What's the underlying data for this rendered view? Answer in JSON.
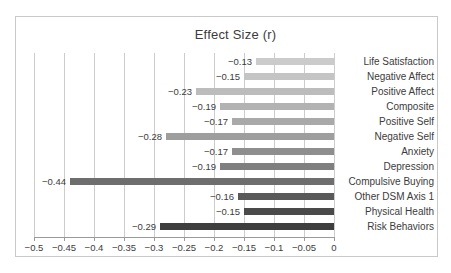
{
  "figure": {
    "title": "Effect Size (r)",
    "border_color": "#c9c9c9",
    "background_color": "#ffffff"
  },
  "chart_data": {
    "type": "bar",
    "orientation": "horizontal",
    "title": "Effect Size (r)",
    "categories": [
      "Life Satisfaction",
      "Negative Affect",
      "Positive Affect",
      "Composite",
      "Positive Self",
      "Negative Self",
      "Anxiety",
      "Depression",
      "Compulsive Buying",
      "Other DSM Axis 1",
      "Physical Health",
      "Risk Behaviors"
    ],
    "values": [
      -0.13,
      -0.15,
      -0.23,
      -0.19,
      -0.17,
      -0.28,
      -0.17,
      -0.19,
      -0.44,
      -0.16,
      -0.15,
      -0.29
    ],
    "value_labels": [
      "−0.13",
      "−0.15",
      "−0.23",
      "−0.19",
      "−0.17",
      "−0.28",
      "−0.17",
      "−0.19",
      "−0.44",
      "−0.16",
      "−0.15",
      "−0.29"
    ],
    "xlabel": "",
    "ylabel": "",
    "xlim": [
      -0.5,
      0
    ],
    "x_ticks": [
      -0.5,
      -0.45,
      -0.4,
      -0.35,
      -0.3,
      -0.25,
      -0.2,
      -0.15,
      -0.1,
      -0.05,
      0
    ],
    "x_tick_labels": [
      "−0.5",
      "−0.45",
      "−0.4",
      "−0.35",
      "−0.3",
      "−0.25",
      "−0.2",
      "−0.15",
      "−0.1",
      "−0.05",
      "0"
    ],
    "grid": true,
    "legend": false,
    "category_labels_position": "right",
    "bar_colors": [
      "#cbcbcb",
      "#c4c4c4",
      "#bcbcbc",
      "#b2b2b2",
      "#a9a9a9",
      "#9e9e9e",
      "#8e8e8e",
      "#7f7f7f",
      "#6e6e6e",
      "#595959",
      "#4a4a4a",
      "#3e3e3e"
    ],
    "grid_color": "#cccccc",
    "axis_color": "#9a9a9a",
    "text_color": "#3c3c3c"
  }
}
